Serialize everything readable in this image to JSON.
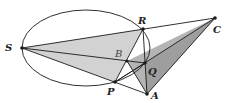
{
  "diagram": {
    "colors": {
      "stroke": "#1a1a1a",
      "fill_light": "#d0d0d0",
      "fill_dark": "#a8a8a8"
    },
    "ellipse": {
      "cx": 86,
      "cy": 48,
      "rx": 64,
      "ry": 38
    },
    "points": [
      {
        "name": "S",
        "x": 22,
        "y": 48,
        "lx": 5,
        "ly": 51
      },
      {
        "name": "R",
        "x": 143,
        "y": 29,
        "lx": 138,
        "ly": 24
      },
      {
        "name": "C",
        "x": 215,
        "y": 18,
        "lx": 214,
        "ly": 33
      },
      {
        "name": "B",
        "x": 127,
        "y": 61,
        "lx": 115,
        "ly": 57
      },
      {
        "name": "Q",
        "x": 145,
        "y": 63,
        "lx": 148,
        "ly": 75
      },
      {
        "name": "P",
        "x": 115,
        "y": 82,
        "lx": 107,
        "ly": 95
      },
      {
        "name": "A",
        "x": 147,
        "y": 94,
        "lx": 151,
        "ly": 99
      }
    ]
  }
}
